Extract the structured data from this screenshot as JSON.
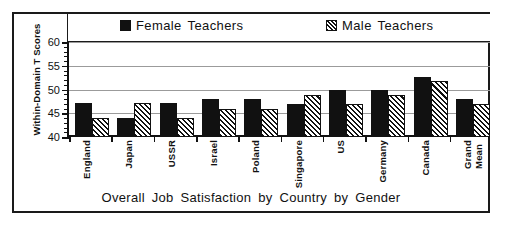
{
  "chart_data": {
    "type": "bar",
    "title": "",
    "xlabel": "Overall Job Satisfaction by Country by Gender",
    "ylabel": "Within-Domain T Scores",
    "ylim": [
      40,
      60
    ],
    "yticks": [
      40,
      45,
      50,
      55,
      60
    ],
    "ytick_labels": [
      "40",
      "45",
      "50",
      "55",
      "60"
    ],
    "grid": true,
    "legend_position": "top",
    "categories": [
      "England",
      "Japan",
      "USSR",
      "Israel",
      "Poland",
      "Singapore",
      "US",
      "Germany",
      "Canada",
      "Grand\nMean"
    ],
    "series": [
      {
        "name": "Female Teachers",
        "fill": "solid",
        "color": "#111111",
        "values": [
          47.2,
          44.1,
          47.2,
          48.1,
          48.1,
          47.0,
          49.9,
          49.8,
          52.7,
          47.9
        ]
      },
      {
        "name": "Male Teachers",
        "fill": "hatch",
        "color": "#111111",
        "values": [
          44.0,
          47.1,
          44.0,
          45.8,
          45.8,
          48.9,
          46.9,
          48.8,
          51.8,
          46.9
        ]
      }
    ]
  },
  "legend": {
    "entries": [
      {
        "label": "Female  Teachers",
        "swatch": "solid-square-swatch"
      },
      {
        "label": "Male  Teachers",
        "swatch": "hatched-square-swatch"
      }
    ]
  },
  "axes": {
    "y_title": "Within-Domain T Scores",
    "x_title": "Overall Job Satisfaction by Country by Gender"
  }
}
